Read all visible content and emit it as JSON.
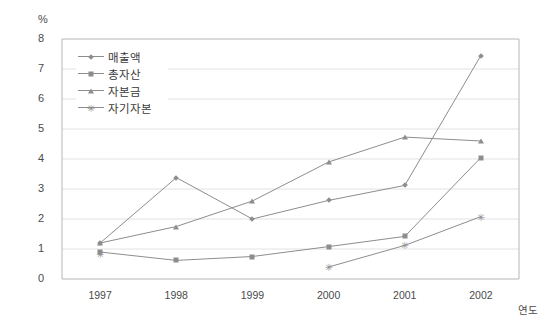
{
  "chart_data": {
    "type": "line",
    "title": "",
    "unit_label": "%",
    "xlabel": "연도",
    "ylabel": "",
    "categories": [
      "1997",
      "1998",
      "1999",
      "2000",
      "2001",
      "2002"
    ],
    "ylim": [
      0,
      8
    ],
    "ytick_step": 1,
    "yticks": [
      "8",
      "7",
      "6",
      "5",
      "4",
      "3",
      "2",
      "1",
      "0"
    ],
    "grid": true,
    "legend_position": "top-left-inside",
    "series": [
      {
        "name": "매출액",
        "marker": "diamond-marker",
        "color": "#8d8d8d",
        "values": [
          1.2,
          3.38,
          2.0,
          2.62,
          3.12,
          7.45
        ]
      },
      {
        "name": "총자산",
        "marker": "square-marker",
        "color": "#8d8d8d",
        "values": [
          0.9,
          0.62,
          0.75,
          1.08,
          1.42,
          4.05
        ]
      },
      {
        "name": "자본금",
        "marker": "triangle-marker",
        "color": "#8d8d8d",
        "values": [
          1.2,
          1.75,
          2.6,
          3.9,
          4.73,
          4.6
        ]
      },
      {
        "name": "자기자본",
        "marker": "star-marker",
        "color": "#8d8d8d",
        "values": [
          0.85,
          null,
          null,
          0.4,
          1.12,
          2.08
        ]
      }
    ]
  },
  "axes": {
    "plot_left": 62,
    "plot_right": 519,
    "plot_top": 39,
    "plot_bottom": 279
  }
}
